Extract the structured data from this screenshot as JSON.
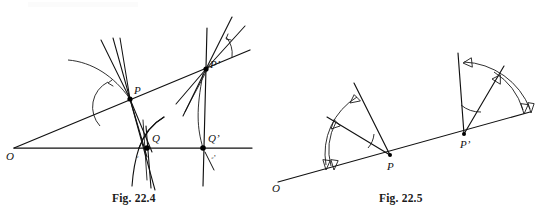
{
  "sheet": {
    "background": "#ffffff",
    "ink_color": "#111111",
    "width": 536,
    "height": 221
  },
  "figures": [
    {
      "id": "fig-22-4",
      "caption": "Fig. 22.4",
      "description": "Two curves C and C' cut by rays from a common point O; tangent lines at P and P' make marked angles with the rays.",
      "labels": {
        "origin": "O",
        "point_p": "P",
        "point_p_prime": "P’",
        "point_q": "Q",
        "point_q_prime": "Q’",
        "curve_c": "ᶜ",
        "curve_c_prime": "ᶜ’"
      },
      "angle_marks": [
        {
          "at": "P",
          "kind": "arc",
          "note": "angle between ray OP and tangent at P"
        },
        {
          "at": "P’",
          "kind": "arc",
          "note": "angle between ray OP’ and tangent at P’"
        }
      ]
    },
    {
      "id": "fig-22-5",
      "caption": "Fig. 22.5",
      "description": "Ray from O meets points P and P'; at each point an angle is swept by a double arrow from the ray to a rotated line.",
      "labels": {
        "origin": "O",
        "point_p": "P",
        "point_p_prime": "P’"
      },
      "angle_marks": [
        {
          "at": "P",
          "kind": "double-arrow-arc",
          "direction": "counterclockwise"
        },
        {
          "at": "P’",
          "kind": "double-arrow-arc",
          "direction": "counterclockwise"
        }
      ]
    }
  ],
  "captions": {
    "left": "Fig. 22.4",
    "right": "Fig. 22.5"
  }
}
